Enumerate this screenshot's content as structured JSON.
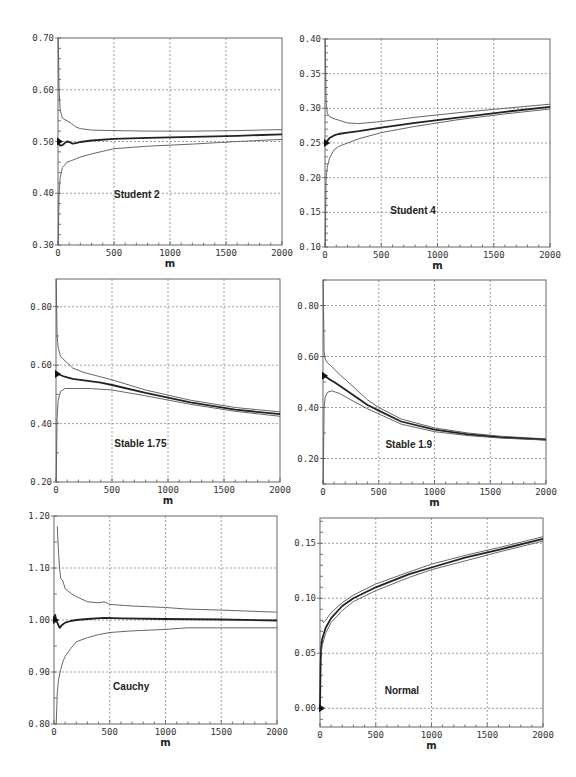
{
  "figure": {
    "width": 576,
    "height": 777,
    "line_color": "#222222",
    "band_color": "#555555",
    "grid_color": "#777777"
  },
  "chart_data": [
    {
      "id": "student2",
      "type": "line",
      "title": "Student 2",
      "xlabel": "m",
      "ylabel": "",
      "xlim": [
        0,
        2000
      ],
      "ylim": [
        0.3,
        0.7
      ],
      "xticks": [
        0,
        500,
        1000,
        1500,
        2000
      ],
      "xtick_labels": [
        "0",
        "500",
        "1000",
        "1500",
        "2000"
      ],
      "yticks": [
        0.3,
        0.4,
        0.5,
        0.6,
        0.7
      ],
      "ytick_labels": [
        "0.30",
        "0.40",
        "0.50",
        "0.60",
        "0.70"
      ],
      "y_minor_step": 0.02,
      "grid": true,
      "marker_value": 0.5,
      "box": {
        "x0": 58,
        "x1": 282,
        "y0": 38,
        "y1": 245
      },
      "label_pos": {
        "x": 500,
        "y": 0.39
      },
      "series": [
        {
          "name": "upper",
          "x": [
            2,
            10,
            20,
            40,
            80,
            120,
            160,
            200,
            300,
            500,
            800,
            1200,
            1600,
            2000
          ],
          "values": [
            0.7,
            0.6,
            0.56,
            0.545,
            0.54,
            0.535,
            0.528,
            0.525,
            0.522,
            0.521,
            0.52,
            0.52,
            0.521,
            0.523
          ]
        },
        {
          "name": "estimate",
          "x": [
            0,
            10,
            20,
            40,
            60,
            80,
            100,
            130,
            160,
            200,
            300,
            500,
            800,
            1200,
            1600,
            2000
          ],
          "values": [
            0.505,
            0.495,
            0.492,
            0.493,
            0.497,
            0.5,
            0.499,
            0.496,
            0.497,
            0.499,
            0.502,
            0.505,
            0.507,
            0.509,
            0.511,
            0.514
          ]
        },
        {
          "name": "lower",
          "x": [
            2,
            10,
            20,
            40,
            80,
            120,
            200,
            300,
            500,
            800,
            1200,
            1600,
            2000
          ],
          "values": [
            0.3,
            0.4,
            0.43,
            0.45,
            0.46,
            0.463,
            0.47,
            0.476,
            0.486,
            0.491,
            0.495,
            0.5,
            0.504
          ]
        }
      ]
    },
    {
      "id": "student4",
      "type": "line",
      "title": "Student 4",
      "xlabel": "m",
      "ylabel": "",
      "xlim": [
        0,
        2000
      ],
      "ylim": [
        0.1,
        0.4
      ],
      "xticks": [
        0,
        500,
        1000,
        1500,
        2000
      ],
      "xtick_labels": [
        "0",
        "500",
        "1000",
        "1500",
        "2000"
      ],
      "yticks": [
        0.1,
        0.15,
        0.2,
        0.25,
        0.3,
        0.35,
        0.4
      ],
      "ytick_labels": [
        "0.10",
        "0.15",
        "0.20",
        "0.25",
        "0.30",
        "0.35",
        "0.40"
      ],
      "y_minor_step": 0.01,
      "grid": true,
      "marker_value": 0.25,
      "box": {
        "x0": 325,
        "x1": 550,
        "y0": 39,
        "y1": 247
      },
      "label_pos": {
        "x": 580,
        "y": 0.148
      },
      "series": [
        {
          "name": "upper",
          "x": [
            2,
            10,
            20,
            40,
            80,
            120,
            200,
            300,
            500,
            800,
            1200,
            1600,
            2000
          ],
          "values": [
            0.4,
            0.31,
            0.293,
            0.288,
            0.285,
            0.283,
            0.279,
            0.278,
            0.281,
            0.287,
            0.294,
            0.3,
            0.306
          ]
        },
        {
          "name": "estimate",
          "x": [
            0,
            10,
            20,
            40,
            80,
            120,
            200,
            300,
            500,
            800,
            1200,
            1600,
            2000
          ],
          "values": [
            0.25,
            0.25,
            0.253,
            0.257,
            0.261,
            0.263,
            0.265,
            0.267,
            0.272,
            0.279,
            0.287,
            0.295,
            0.302
          ]
        },
        {
          "name": "lower",
          "x": [
            2,
            10,
            20,
            40,
            80,
            120,
            200,
            300,
            500,
            800,
            1200,
            1600,
            2000
          ],
          "values": [
            0.1,
            0.2,
            0.215,
            0.228,
            0.24,
            0.245,
            0.25,
            0.256,
            0.265,
            0.274,
            0.284,
            0.292,
            0.299
          ]
        }
      ]
    },
    {
      "id": "stable175",
      "type": "line",
      "title": "Stable 1.75",
      "xlabel": "m",
      "ylabel": "",
      "xlim": [
        0,
        2000
      ],
      "ylim": [
        0.2,
        0.895
      ],
      "xticks": [
        0,
        500,
        1000,
        1500,
        2000
      ],
      "xtick_labels": [
        "0",
        "500",
        "1000",
        "1500",
        "2000"
      ],
      "yticks": [
        0.2,
        0.4,
        0.6,
        0.8
      ],
      "ytick_labels": [
        "0.20",
        "0.40",
        "0.60",
        "0.80"
      ],
      "y_minor_step": 0.1,
      "grid": true,
      "marker_value": 0.57,
      "box": {
        "x0": 56,
        "x1": 280,
        "y0": 279,
        "y1": 482
      },
      "label_pos": {
        "x": 520,
        "y": 0.32
      },
      "series": [
        {
          "name": "upper",
          "x": [
            2,
            10,
            20,
            40,
            80,
            150,
            250,
            500,
            800,
            1200,
            1600,
            2000
          ],
          "values": [
            0.895,
            0.7,
            0.66,
            0.63,
            0.615,
            0.59,
            0.575,
            0.55,
            0.515,
            0.48,
            0.455,
            0.44
          ]
        },
        {
          "name": "estimate",
          "x": [
            0,
            10,
            30,
            60,
            100,
            150,
            250,
            400,
            500,
            800,
            1200,
            1600,
            2000
          ],
          "values": [
            0.57,
            0.57,
            0.568,
            0.563,
            0.558,
            0.553,
            0.548,
            0.54,
            0.532,
            0.505,
            0.473,
            0.448,
            0.432
          ]
        },
        {
          "name": "lower",
          "x": [
            2,
            10,
            20,
            40,
            80,
            150,
            300,
            500,
            800,
            1200,
            1600,
            2000
          ],
          "values": [
            0.2,
            0.42,
            0.48,
            0.51,
            0.52,
            0.52,
            0.52,
            0.515,
            0.495,
            0.466,
            0.442,
            0.425
          ]
        }
      ]
    },
    {
      "id": "stable19",
      "type": "line",
      "title": "Stable 1.9",
      "xlabel": "m",
      "ylabel": "",
      "xlim": [
        0,
        2000
      ],
      "ylim": [
        0.1,
        0.9
      ],
      "xticks": [
        0,
        500,
        1000,
        1500,
        2000
      ],
      "xtick_labels": [
        "0",
        "500",
        "1000",
        "1500",
        "2000"
      ],
      "yticks": [
        0.2,
        0.4,
        0.6,
        0.8
      ],
      "ytick_labels": [
        "0.20",
        "0.40",
        "0.60",
        "0.80"
      ],
      "y_minor_step": 0.1,
      "grid": true,
      "marker_value": 0.525,
      "box": {
        "x0": 323,
        "x1": 546,
        "y0": 280,
        "y1": 484
      },
      "label_pos": {
        "x": 560,
        "y": 0.24
      },
      "series": [
        {
          "name": "upper",
          "x": [
            2,
            10,
            20,
            40,
            80,
            150,
            250,
            400,
            500,
            700,
            1000,
            1300,
            1600,
            2000
          ],
          "values": [
            0.9,
            0.62,
            0.59,
            0.575,
            0.56,
            0.53,
            0.49,
            0.43,
            0.4,
            0.355,
            0.32,
            0.3,
            0.287,
            0.277
          ]
        },
        {
          "name": "estimate",
          "x": [
            0,
            10,
            30,
            60,
            100,
            150,
            250,
            400,
            500,
            700,
            1000,
            1300,
            1600,
            2000
          ],
          "values": [
            0.525,
            0.525,
            0.52,
            0.51,
            0.5,
            0.485,
            0.455,
            0.41,
            0.388,
            0.345,
            0.313,
            0.295,
            0.283,
            0.274
          ]
        },
        {
          "name": "lower",
          "x": [
            2,
            10,
            20,
            40,
            80,
            150,
            250,
            400,
            500,
            700,
            1000,
            1300,
            1600,
            2000
          ],
          "values": [
            0.1,
            0.4,
            0.44,
            0.46,
            0.465,
            0.455,
            0.43,
            0.395,
            0.375,
            0.335,
            0.305,
            0.29,
            0.28,
            0.272
          ]
        }
      ]
    },
    {
      "id": "cauchy",
      "type": "line",
      "title": "Cauchy",
      "xlabel": "m",
      "ylabel": "",
      "xlim": [
        0,
        2000
      ],
      "ylim": [
        0.8,
        1.2
      ],
      "xticks": [
        0,
        500,
        1000,
        1500,
        2000
      ],
      "xtick_labels": [
        "0",
        "500",
        "1000",
        "1500",
        "2000"
      ],
      "yticks": [
        0.8,
        0.9,
        1.0,
        1.1,
        1.2
      ],
      "ytick_labels": [
        "0.80",
        "0.90",
        "1.00",
        "1.10",
        "1.20"
      ],
      "y_minor_step": 0.05,
      "grid": true,
      "marker_value": 1.0,
      "box": {
        "x0": 54,
        "x1": 277,
        "y0": 516,
        "y1": 724
      },
      "label_pos": {
        "x": 530,
        "y": 0.865
      },
      "series": [
        {
          "name": "upper",
          "x": [
            30,
            40,
            50,
            60,
            80,
            100,
            130,
            160,
            200,
            250,
            300,
            400,
            450,
            500,
            700,
            1000,
            1200,
            1500,
            2000
          ],
          "values": [
            1.18,
            1.13,
            1.1,
            1.08,
            1.075,
            1.06,
            1.055,
            1.05,
            1.045,
            1.04,
            1.035,
            1.033,
            1.035,
            1.03,
            1.027,
            1.024,
            1.021,
            1.019,
            1.015
          ]
        },
        {
          "name": "estimate",
          "x": [
            0,
            10,
            20,
            30,
            50,
            70,
            100,
            150,
            200,
            300,
            450,
            600,
            1000,
            1500,
            2000
          ],
          "values": [
            1.0,
            1.01,
            1.0,
            0.995,
            0.985,
            0.99,
            0.995,
            0.998,
            1.0,
            1.002,
            1.004,
            1.003,
            1.002,
            1.001,
            0.999
          ]
        },
        {
          "name": "lower",
          "x": [
            20,
            30,
            40,
            60,
            80,
            100,
            150,
            200,
            300,
            400,
            500,
            700,
            1000,
            1200,
            1500,
            2000
          ],
          "values": [
            0.8,
            0.86,
            0.885,
            0.905,
            0.92,
            0.93,
            0.945,
            0.958,
            0.966,
            0.972,
            0.976,
            0.979,
            0.982,
            0.985,
            0.985,
            0.985
          ]
        }
      ]
    },
    {
      "id": "normal",
      "type": "line",
      "title": "Normal",
      "xlabel": "m",
      "ylabel": "",
      "xlim": [
        0,
        2000
      ],
      "ylim": [
        -0.017,
        0.173
      ],
      "xticks": [
        0,
        500,
        1000,
        1500,
        2000
      ],
      "xtick_labels": [
        "0",
        "500",
        "1000",
        "1500",
        "2000"
      ],
      "yticks": [
        0.0,
        0.05,
        0.1,
        0.15
      ],
      "ytick_labels": [
        "0.00",
        "0.05",
        "0.10",
        "0.15"
      ],
      "y_minor_step": 0.01,
      "grid": true,
      "marker_value": 0.0,
      "box": {
        "x0": 320,
        "x1": 543,
        "y0": 518,
        "y1": 727
      },
      "label_pos": {
        "x": 580,
        "y": 0.013
      },
      "series": [
        {
          "name": "upper",
          "x": [
            20,
            30,
            50,
            100,
            200,
            300,
            500,
            800,
            1000,
            1300,
            1600,
            2000
          ],
          "values": [
            0.08,
            0.078,
            0.08,
            0.087,
            0.096,
            0.103,
            0.113,
            0.124,
            0.131,
            0.139,
            0.146,
            0.156
          ]
        },
        {
          "name": "estimate",
          "x": [
            0,
            5,
            10,
            20,
            50,
            100,
            200,
            300,
            500,
            800,
            1000,
            1300,
            1600,
            2000
          ],
          "values": [
            0.0,
            0.04,
            0.055,
            0.063,
            0.073,
            0.082,
            0.093,
            0.1,
            0.11,
            0.122,
            0.128,
            0.137,
            0.144,
            0.154
          ]
        },
        {
          "name": "lower",
          "x": [
            10,
            20,
            50,
            100,
            200,
            300,
            500,
            800,
            1000,
            1300,
            1600,
            2000
          ],
          "values": [
            0.05,
            0.057,
            0.068,
            0.078,
            0.089,
            0.097,
            0.107,
            0.119,
            0.126,
            0.134,
            0.142,
            0.152
          ]
        }
      ]
    }
  ]
}
